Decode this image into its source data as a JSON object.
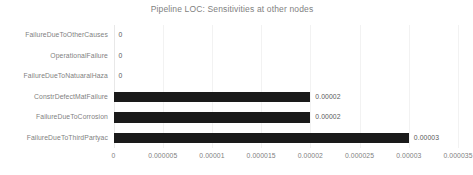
{
  "chart_data": {
    "type": "bar",
    "orientation": "horizontal",
    "title": "Pipeline LOC: Sensitivities at other nodes",
    "xlabel": "",
    "ylabel": "",
    "categories": [
      "FailureDueToOtherCauses",
      "OperationalFailure",
      "FailureDueToNatuaralHaza",
      "ConstrDefectMatFailure",
      "FailureDueToCorrosion",
      "FailureDueToThirdPartyac"
    ],
    "values": [
      0,
      0,
      0,
      2e-05,
      2e-05,
      3e-05
    ],
    "value_labels": [
      "0",
      "0",
      "0",
      "0.00002",
      "0.00002",
      "0.00003"
    ],
    "xlim": [
      0,
      3.5e-05
    ],
    "xticks": [
      0,
      5e-06,
      1e-05,
      1.5e-05,
      2e-05,
      2.5e-05,
      3e-05,
      3.5e-05
    ],
    "xtick_labels": [
      "0",
      "0.000005",
      "0.00001",
      "0.000015",
      "0.00002",
      "0.000025",
      "0.00003",
      "0.000035"
    ],
    "grid": true,
    "grid_axis": "x",
    "legend": false,
    "bar_color": "#1a1a1a",
    "title_color": "#7f7f7f",
    "label_color": "#7f7f7f",
    "gridline_color": "#f2f2f2"
  }
}
